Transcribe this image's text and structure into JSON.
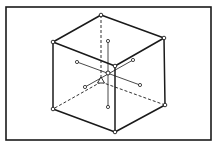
{
  "diagram": {
    "type": "isometric-cube-with-axes",
    "colors": {
      "line": "#1a1a1a",
      "background": "#ffffff",
      "node_fill": "#ffffff"
    },
    "frame": {
      "x": 6,
      "y": 7,
      "width": 205,
      "height": 133
    },
    "cube": {
      "vertices": {
        "top_back": [
          101,
          15
        ],
        "top_left": [
          53,
          42
        ],
        "top_right": [
          164,
          38
        ],
        "top_front": [
          115,
          66
        ],
        "bottom_left": [
          53,
          109
        ],
        "bottom_right": [
          165,
          105
        ],
        "bottom_front": [
          115,
          132
        ],
        "bottom_back": [
          101,
          82
        ]
      },
      "visible_edges": [
        [
          "top_back",
          "top_left"
        ],
        [
          "top_back",
          "top_right"
        ],
        [
          "top_left",
          "top_front"
        ],
        [
          "top_right",
          "top_front"
        ],
        [
          "top_left",
          "bottom_left"
        ],
        [
          "top_right",
          "bottom_right"
        ],
        [
          "top_front",
          "bottom_front"
        ],
        [
          "bottom_left",
          "bottom_front"
        ],
        [
          "bottom_right",
          "bottom_front"
        ]
      ],
      "hidden_edges": [
        [
          "top_back",
          "bottom_back"
        ],
        [
          "bottom_back",
          "bottom_left"
        ],
        [
          "bottom_back",
          "bottom_right"
        ]
      ]
    },
    "center": [
      108,
      73
    ],
    "axes": [
      {
        "name": "vertical-axis",
        "from": [
          108,
          41
        ],
        "to": [
          108,
          107
        ]
      },
      {
        "name": "axis-a",
        "from": [
          77,
          62
        ],
        "to": [
          140,
          85
        ]
      },
      {
        "name": "axis-b",
        "from": [
          85,
          87
        ],
        "to": [
          133,
          60
        ]
      }
    ],
    "marker": {
      "shape": "triangle",
      "at": [
        101,
        81
      ]
    }
  }
}
